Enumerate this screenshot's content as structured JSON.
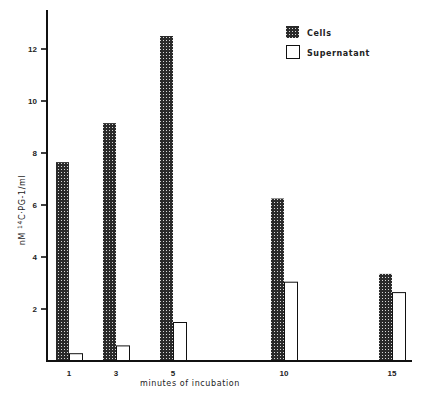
{
  "chart_data": {
    "type": "bar",
    "title": "",
    "xlabel": "minutes of incubation",
    "ylabel": "nM 14C·PG-1/ml",
    "ylabel_parts": {
      "prefix": "nM ",
      "superscript": "14",
      "suffix": "C·PG-1/ml"
    },
    "categories": [
      "1",
      "3",
      "5",
      "10",
      "15"
    ],
    "x": [
      1,
      3,
      5,
      10,
      15
    ],
    "series": [
      {
        "name": "Cells",
        "fill": "checker-dark",
        "values": [
          7.65,
          9.15,
          12.5,
          6.25,
          3.35
        ]
      },
      {
        "name": "Supernatant",
        "fill": "white",
        "values": [
          0.3,
          0.6,
          1.5,
          3.05,
          2.65
        ]
      }
    ],
    "y_ticks": [
      2,
      4,
      6,
      8,
      10,
      12
    ],
    "ylim": [
      0,
      13.5
    ],
    "grid": false,
    "legend_position": "top-right"
  },
  "legend": {
    "items": [
      {
        "label": "Cells",
        "swatch": "checker-dark"
      },
      {
        "label": "Supernatant",
        "swatch": "white"
      }
    ]
  },
  "colors": {
    "axis": "#111111",
    "bar_dark": "#2a2a2a",
    "bar_light_dot": "#d8d8d8",
    "background": "#ffffff"
  }
}
